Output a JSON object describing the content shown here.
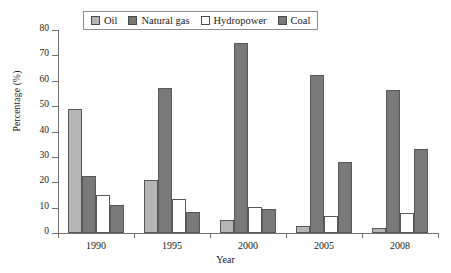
{
  "chart_data": {
    "type": "bar",
    "title": "",
    "xlabel": "Year",
    "ylabel": "Percentage (%)",
    "categories": [
      "1990",
      "1995",
      "2000",
      "2005",
      "2008"
    ],
    "ylim": [
      0,
      80
    ],
    "yticks": [
      0,
      10,
      20,
      30,
      40,
      50,
      60,
      70,
      80
    ],
    "grid": false,
    "legend_position": "top-center",
    "series": [
      {
        "name": "Oil",
        "color": "#b5b5b5",
        "values": [
          49,
          20.8,
          5,
          2.9,
          1.9
        ]
      },
      {
        "name": "Natural gas",
        "color": "#797979",
        "values": [
          22.4,
          57,
          75,
          62.2,
          56.5
        ]
      },
      {
        "name": "Hydropower",
        "color": "#ffffff",
        "values": [
          15,
          13.5,
          10.3,
          6.6,
          8
        ]
      },
      {
        "name": "Coal",
        "color": "#797979",
        "values": [
          11,
          8.3,
          9.6,
          28,
          33.2
        ]
      }
    ]
  }
}
